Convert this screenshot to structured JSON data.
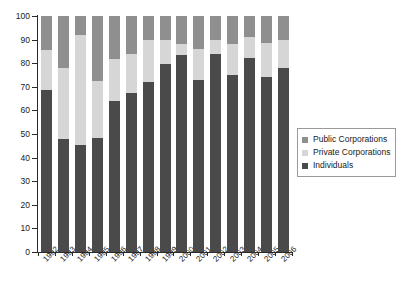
{
  "chart_data": {
    "type": "bar",
    "stacked": true,
    "title": "",
    "subtitle": "",
    "xlabel": "",
    "ylabel": "",
    "ylim": [
      0,
      100
    ],
    "yticks": [
      0,
      10,
      20,
      30,
      40,
      50,
      60,
      70,
      80,
      90,
      100
    ],
    "grid": false,
    "legend_position": "right",
    "categories": [
      "1992",
      "1993",
      "1994",
      "1995",
      "1996",
      "1997",
      "1998",
      "1999",
      "2000",
      "2001",
      "2002",
      "2003",
      "2004",
      "2005",
      "2006"
    ],
    "series": [
      {
        "name": "Individuals",
        "color": "#4a4a4a",
        "values": [
          68.5,
          48,
          45.5,
          48.5,
          64,
          67.5,
          72,
          79.5,
          83.5,
          73,
          84,
          75,
          82,
          74,
          78
        ]
      },
      {
        "name": "Private Corporations",
        "color": "#d6d6d6",
        "values": [
          17,
          30,
          46.5,
          24,
          18,
          16.5,
          18,
          10.5,
          4.5,
          13,
          6,
          13,
          9,
          14.5,
          12
        ]
      },
      {
        "name": "Public Corporations",
        "color": "#8f8f8f",
        "values": [
          14.5,
          22,
          8,
          27.5,
          18,
          16,
          10,
          10,
          12,
          14,
          10,
          12,
          9,
          11.5,
          10
        ]
      }
    ],
    "cumulative_tops": {
      "individuals": [
        68.5,
        48,
        45.5,
        48.5,
        64,
        67.5,
        72,
        79.5,
        83.5,
        73,
        84,
        75,
        82,
        74,
        78
      ],
      "private": [
        85.5,
        78,
        92,
        72.5,
        82,
        84,
        90,
        90,
        88,
        86,
        90,
        88,
        91,
        88.5,
        90
      ],
      "public": [
        100,
        100,
        100,
        100,
        100,
        100,
        100,
        100,
        100,
        100,
        100,
        100,
        100,
        100,
        100
      ]
    }
  },
  "legend": {
    "entries": [
      {
        "label": "Public Corporations",
        "color": "#8f8f8f"
      },
      {
        "label": "Private Corporations",
        "color": "#d6d6d6"
      },
      {
        "label": "Individuals",
        "color": "#4a4a4a"
      }
    ]
  },
  "axes": {
    "y_tick_labels": [
      "0",
      "10",
      "20",
      "30",
      "40",
      "50",
      "60",
      "70",
      "80",
      "90",
      "100"
    ],
    "x_tick_labels": [
      "1992",
      "1993",
      "1994",
      "1995",
      "1996",
      "1997",
      "1998",
      "1999",
      "2000",
      "2001",
      "2002",
      "2003",
      "2004",
      "2005",
      "2006"
    ]
  }
}
